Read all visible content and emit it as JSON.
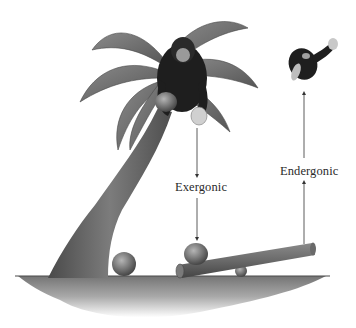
{
  "figure": {
    "labels": {
      "exergonic": "Exergonic",
      "endergonic": "Endergonic"
    },
    "arrows": [
      {
        "name": "exergonic-arrow",
        "direction": "down",
        "from": "chimp-in-tree",
        "to": "coconut-on-seesaw"
      },
      {
        "name": "endergonic-arrow",
        "direction": "up",
        "from": "seesaw-raised-end",
        "to": "flying-chimp"
      }
    ],
    "elements": [
      "palm-tree",
      "chimp-in-tree",
      "held-coconut",
      "fallen-coconut",
      "seesaw-plank",
      "seesaw-fulcrum",
      "coconut-on-seesaw",
      "flying-chimp",
      "ground"
    ],
    "colors": {
      "ink": "#2a2a2a",
      "foliage": "#6e6e6e",
      "trunk": "#5a5a5a",
      "fur": "#1e1e1e",
      "coconut": "#7a7a7a",
      "ground": "#8a8a8a",
      "background": "#ffffff"
    }
  }
}
